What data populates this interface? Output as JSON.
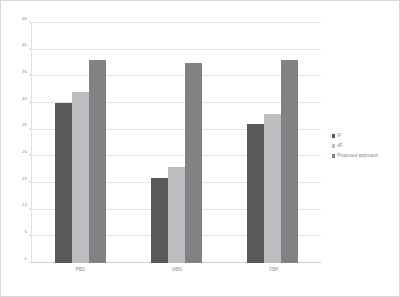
{
  "chart_data": {
    "type": "bar",
    "title": "",
    "xlabel": "",
    "ylabel": "",
    "ylim": [
      0,
      45
    ],
    "ytick_step": 5,
    "yticks": [
      0,
      5,
      10,
      15,
      20,
      25,
      30,
      35,
      40,
      45
    ],
    "ytick_labels": [
      "0",
      "5",
      "10",
      "15",
      "20",
      "25",
      "30",
      "35",
      "40",
      "45"
    ],
    "categories": [
      "PBS",
      "MBS",
      "FBP"
    ],
    "grid": true,
    "legend_position": "right",
    "series": [
      {
        "name": "IF",
        "color": "#58595b",
        "values": [
          30,
          16,
          26
        ]
      },
      {
        "name": "dF",
        "color": "#bcbdbf",
        "values": [
          32,
          18,
          28
        ]
      },
      {
        "name": "Proposed approach",
        "color": "#808285",
        "values": [
          38,
          37.5,
          38
        ]
      }
    ]
  },
  "colors": {
    "series_1": "#58595b",
    "series_2": "#bcbdbf",
    "series_3": "#808285",
    "gridline": "#e4e4e4",
    "axis": "#d0d0d0",
    "tick_text": "#8a8a8a",
    "panel_border": "#d8d8d8",
    "background": "#ffffff"
  }
}
